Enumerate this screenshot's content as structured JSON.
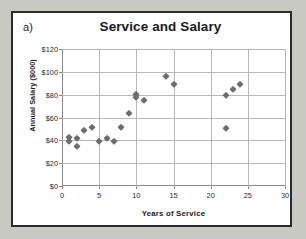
{
  "panel": {
    "label": "a)"
  },
  "chart_data": {
    "type": "scatter",
    "title": "Service and Salary",
    "xlabel": "Years of Service",
    "ylabel": "Annual Salary ($000)",
    "xlim": [
      0,
      30
    ],
    "ylim": [
      0,
      120
    ],
    "xticks": [
      0,
      5,
      10,
      15,
      20,
      25,
      30
    ],
    "xtick_labels": [
      "0",
      "5",
      "10",
      "15",
      "20",
      "25",
      "30"
    ],
    "yticks": [
      0,
      20,
      40,
      60,
      80,
      100,
      120
    ],
    "ytick_labels": [
      "$0",
      "$20",
      "$40",
      "$60",
      "$80",
      "$100",
      "$120"
    ],
    "grid": "horizontal-and-vertical",
    "legend": "none",
    "marker": "diamond",
    "marker_color": "#6d6d6d",
    "series": [
      {
        "name": "Employees",
        "points": [
          [
            1,
            43
          ],
          [
            1,
            39
          ],
          [
            2,
            42
          ],
          [
            2,
            35
          ],
          [
            3,
            49
          ],
          [
            4,
            52
          ],
          [
            5,
            39
          ],
          [
            6,
            42
          ],
          [
            7,
            39
          ],
          [
            8,
            52
          ],
          [
            9,
            64
          ],
          [
            10,
            81
          ],
          [
            10,
            78
          ],
          [
            11,
            75
          ],
          [
            14,
            96
          ],
          [
            15,
            89
          ],
          [
            22,
            80
          ],
          [
            22,
            51
          ],
          [
            23,
            85
          ],
          [
            24,
            89
          ]
        ]
      }
    ]
  }
}
